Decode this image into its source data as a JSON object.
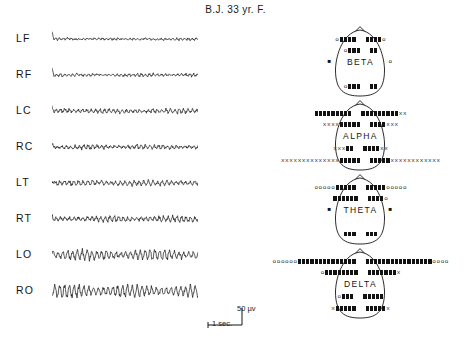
{
  "title": "B.J.  33 yr. F.",
  "traces": {
    "channels": [
      {
        "label": "LF",
        "name": "left-frontal"
      },
      {
        "label": "RF",
        "name": "right-frontal"
      },
      {
        "label": "LC",
        "name": "left-central"
      },
      {
        "label": "RC",
        "name": "right-central"
      },
      {
        "label": "LT",
        "name": "left-temporal"
      },
      {
        "label": "RT",
        "name": "right-temporal"
      },
      {
        "label": "LO",
        "name": "left-occipital"
      },
      {
        "label": "RO",
        "name": "right-occipital"
      }
    ]
  },
  "calibration": {
    "amplitude_label": "50 µv",
    "time_label": "1 sec."
  },
  "maps": {
    "bands": [
      {
        "name": "BETA",
        "rows": [
          {
            "left": [
              {
                "g": "o",
                "n": 1
              },
              {
                "g": "sq",
                "n": 4
              }
            ],
            "right": [
              {
                "g": "sq",
                "n": 4
              },
              {
                "g": "o",
                "n": 1
              }
            ]
          },
          {
            "left": [
              {
                "g": "o",
                "n": 1
              },
              {
                "g": "sq",
                "n": 3
              }
            ],
            "right": [
              {
                "g": "sq",
                "n": 2
              }
            ]
          },
          {
            "left": [],
            "right": []
          },
          {
            "left": [
              {
                "g": "o",
                "n": 1
              },
              {
                "g": "sq",
                "n": 3
              }
            ],
            "right": [
              {
                "g": "sq",
                "n": 2
              }
            ]
          }
        ],
        "side_left": "■",
        "side_right": "o"
      },
      {
        "name": "ALPHA",
        "rows": [
          {
            "left": [
              {
                "g": "sq",
                "n": 9
              }
            ],
            "right": [
              {
                "g": "sq",
                "n": 9
              },
              {
                "g": "x",
                "n": 2
              }
            ]
          },
          {
            "left": [
              {
                "g": "x",
                "n": 4
              },
              {
                "g": "sq",
                "n": 5
              }
            ],
            "right": [
              {
                "g": "sq",
                "n": 4
              },
              {
                "g": "x",
                "n": 3
              }
            ]
          },
          {
            "left": [
              {
                "g": "x",
                "n": 3
              },
              {
                "g": "sq",
                "n": 2
              }
            ],
            "right": [
              {
                "g": "sq",
                "n": 4
              },
              {
                "g": "x",
                "n": 2
              }
            ]
          },
          {
            "left": [
              {
                "g": "x",
                "n": 14
              },
              {
                "g": "sq",
                "n": 5
              }
            ],
            "right": [
              {
                "g": "sq",
                "n": 5
              },
              {
                "g": "x",
                "n": 12
              }
            ]
          }
        ],
        "side_left": "",
        "side_right": ""
      },
      {
        "name": "THETA",
        "rows": [
          {
            "left": [
              {
                "g": "o",
                "n": 5
              },
              {
                "g": "sq",
                "n": 5
              }
            ],
            "right": [
              {
                "g": "sq",
                "n": 5
              },
              {
                "g": "o",
                "n": 5
              }
            ]
          },
          {
            "left": [
              {
                "g": "sq",
                "n": 6
              }
            ],
            "right": [
              {
                "g": "sq",
                "n": 4
              },
              {
                "g": "o",
                "n": 1
              }
            ]
          },
          {
            "left": [],
            "right": []
          },
          {
            "left": [
              {
                "g": "sq",
                "n": 3
              }
            ],
            "right": [
              {
                "g": "sq",
                "n": 3
              }
            ]
          }
        ],
        "side_left": "■",
        "side_right": "■"
      },
      {
        "name": "DELTA",
        "rows": [
          {
            "left": [
              {
                "g": "o",
                "n": 6
              },
              {
                "g": "sq",
                "n": 14
              }
            ],
            "right": [
              {
                "g": "sq",
                "n": 16
              },
              {
                "g": "o",
                "n": 4
              }
            ]
          },
          {
            "left": [
              {
                "g": "o",
                "n": 1
              },
              {
                "g": "sq",
                "n": 8
              }
            ],
            "right": [
              {
                "g": "sq",
                "n": 7
              },
              {
                "g": "x",
                "n": 1
              }
            ]
          },
          {
            "left": [
              {
                "g": "o",
                "n": 1
              },
              {
                "g": "sq",
                "n": 3
              }
            ],
            "right": [
              {
                "g": "sq",
                "n": 5
              }
            ]
          },
          {
            "left": [
              {
                "g": "x",
                "n": 1
              },
              {
                "g": "sq",
                "n": 5
              }
            ],
            "right": [
              {
                "g": "sq",
                "n": 5
              },
              {
                "g": "x",
                "n": 1
              }
            ]
          }
        ],
        "side_left": "",
        "side_right": ""
      }
    ]
  }
}
